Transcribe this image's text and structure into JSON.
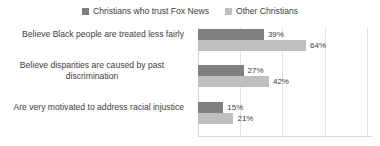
{
  "chart_data": {
    "type": "bar",
    "orientation": "horizontal",
    "title": "",
    "subtitle": "",
    "xlabel": "",
    "ylabel": "",
    "grid": true,
    "legend_position": "top",
    "xlim": [
      0,
      103
    ],
    "gridline_values": [
      0,
      25,
      50,
      75,
      100
    ],
    "value_suffix": "%",
    "categories": [
      "Believe Black people are treated less fairly",
      "Believe disparities are caused by past discrimination",
      "Are very motivated to address racial injustice"
    ],
    "category_lines": [
      [
        "Believe Black people are treated less fairly"
      ],
      [
        "Believe disparities are caused by past",
        "discrimination"
      ],
      [
        "Are very motivated to address racial injustice"
      ]
    ],
    "series": [
      {
        "name": "Christians who trust Fox News",
        "color": "#808080",
        "values": [
          39,
          27,
          15
        ],
        "labels": [
          "39%",
          "27%",
          "15%"
        ]
      },
      {
        "name": "Other Christians",
        "color": "#bfbfbf",
        "values": [
          64,
          42,
          21
        ],
        "labels": [
          "64%",
          "42%",
          "21%"
        ]
      }
    ]
  },
  "legend": {
    "entries": [
      {
        "label": "Christians who trust Fox News",
        "color": "#808080"
      },
      {
        "label": "Other Christians",
        "color": "#bfbfbf"
      }
    ]
  },
  "colors": {
    "series_dark": "#808080",
    "series_light": "#bfbfbf",
    "gridline": "#e2e2e2",
    "text": "#3d3d3d",
    "background": "#ffffff"
  }
}
